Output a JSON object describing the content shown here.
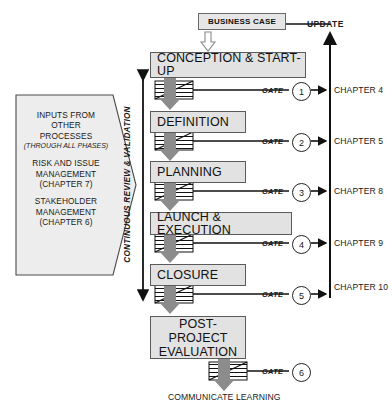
{
  "diagram": {
    "business_case": "BUSINESS CASE",
    "update_label": "UPDATE",
    "continuous_review_label": "CONTINUOUS REVIEW & VALIDATION",
    "communicate_learning": "COMMUNICATE LEARNING",
    "gate_label": "GATE"
  },
  "inputs_arrow": {
    "line1": "INPUTS FROM",
    "line2": "OTHER",
    "line3": "PROCESSES",
    "line4": "(THROUGH ALL PHASES)",
    "line5": "RISK AND ISSUE",
    "line6": "MANAGEMENT",
    "line7": "(CHAPTER 7)",
    "line8": "STAKEHOLDER",
    "line9": "MANAGEMENT",
    "line10": "(CHAPTER 6)"
  },
  "phases": [
    {
      "name": "CONCEPTION & START-UP",
      "gate": "1",
      "chapter": "CHAPTER 4"
    },
    {
      "name": "DEFINITION",
      "gate": "2",
      "chapter": "CHAPTER 5"
    },
    {
      "name": "PLANNING",
      "gate": "3",
      "chapter": "CHAPTER 8"
    },
    {
      "name": "LAUNCH & EXECUTION",
      "gate": "4",
      "chapter": "CHAPTER 9"
    },
    {
      "name": "CLOSURE",
      "gate": "5",
      "chapter": "CHAPTER 10"
    }
  ],
  "post_project": {
    "line1": "POST-PROJECT",
    "line2": "EVALUATION",
    "gate": "6"
  },
  "colors": {
    "box_fill": "#e2e2e2",
    "box_stroke": "#5b5b5b",
    "arrow_gray": "#8c8c8c",
    "line_black": "#111111",
    "inputs_fill": "#ededed"
  }
}
